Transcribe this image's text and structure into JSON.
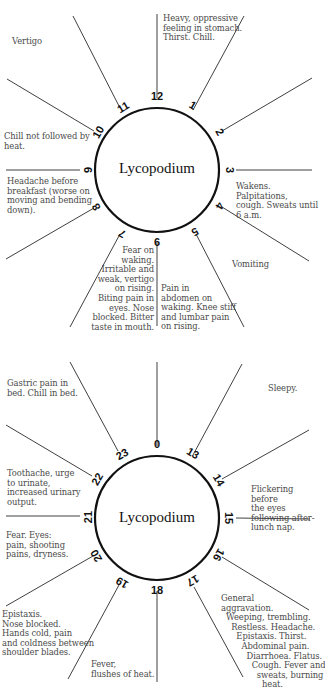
{
  "diagrams": [
    {
      "remedy": "Lycopodium",
      "hours": [
        {
          "num": "12",
          "angle": 0
        },
        {
          "num": "1",
          "angle": 30
        },
        {
          "num": "2",
          "angle": 60
        },
        {
          "num": "3",
          "angle": 90
        },
        {
          "num": "4",
          "angle": 120
        },
        {
          "num": "5",
          "angle": 150
        },
        {
          "num": "6",
          "angle": 180
        },
        {
          "num": "7",
          "angle": 210
        },
        {
          "num": "8",
          "angle": 240
        },
        {
          "num": "9",
          "angle": 270
        },
        {
          "num": "10",
          "angle": 300
        },
        {
          "num": "11",
          "angle": 330
        }
      ],
      "notes": {
        "vertigo": "Vertigo",
        "heavy": "Heavy, oppressive\nfeeling in stomach.\nThirst. Chill.",
        "chill": "Chill not followed by\nheat.",
        "wakens": "Wakens. Palpitations,\ncough. Sweats until\n6 a.m.",
        "headache": "Headache before\nbreakfast (worse on\nmoving and bending\ndown).",
        "vomiting": "Vomiting",
        "fear": "Fear on\nwaking.\nIrritable and\nweak, vertigo\non rising.\nBiting pain in\neyes. Nose\nblocked. Bitter\ntaste in mouth.",
        "pain": "Pain in\nabdomen on\nwaking. Knee stiff\nand lumbar pain\non rising."
      }
    },
    {
      "remedy": "Lycopodium",
      "hours": [
        {
          "num": "0",
          "angle": 0
        },
        {
          "num": "13",
          "angle": 30
        },
        {
          "num": "14",
          "angle": 60
        },
        {
          "num": "15",
          "angle": 90
        },
        {
          "num": "16",
          "angle": 120
        },
        {
          "num": "17",
          "angle": 150
        },
        {
          "num": "18",
          "angle": 180
        },
        {
          "num": "19",
          "angle": 210
        },
        {
          "num": "20",
          "angle": 240
        },
        {
          "num": "21",
          "angle": 270
        },
        {
          "num": "22",
          "angle": 300
        },
        {
          "num": "23",
          "angle": 330
        }
      ],
      "notes": {
        "gastric": "Gastric pain in\nbed. Chill in bed.",
        "sleepy": "Sleepy.",
        "toothache": "Toothache, urge\nto urinate,\nincreased urinary\noutput.",
        "flickering": "Flickering before\nthe eyes\nfollowing after-\nlunch nap.",
        "fear": "Fear. Eyes:\npain, shooting\npains, dryness.",
        "epistaxis": "Epistaxis.\nNose blocked.\nHands cold, pain\nand coldness between\nshoulder blades.",
        "fever": "Fever,\nflushes of heat.",
        "general": "General\naggravation.\n  Weeping, trembling.\n    Restless. Headache.\n      Epistaxis. Thirst.\n        Abdominal pain.\n          Diarrhoea. Flatus.\n            Cough. Fever and\n              sweats, burning\n                heat."
      }
    }
  ],
  "colors": {
    "line": "#2a2a2a",
    "circle": "#111111",
    "note_text": "#4a4a4a"
  }
}
